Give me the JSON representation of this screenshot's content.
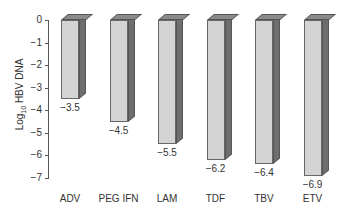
{
  "chart_data": {
    "type": "bar",
    "title": "",
    "xlabel": "",
    "ylabel": "Log10 HBV DNA",
    "ylim": [
      -7,
      0
    ],
    "yticks": [
      0,
      -1,
      -2,
      -3,
      -4,
      -5,
      -6,
      -7
    ],
    "ytick_labels": [
      "0",
      "−1",
      "−2",
      "−3",
      "−4",
      "−5",
      "−6",
      "−7"
    ],
    "categories": [
      "ADV",
      "PEG IFN",
      "LAM",
      "TDF",
      "TBV",
      "ETV"
    ],
    "values": [
      -3.5,
      -4.5,
      -5.5,
      -6.2,
      -6.4,
      -6.9
    ],
    "value_labels": [
      "−3.5",
      "−4.5",
      "−5.5",
      "−6.2",
      "−6.4",
      "−6.9"
    ],
    "grid": false,
    "legend": null,
    "style": "3d-bars",
    "colors": {
      "front": "#d4d4d4",
      "side": "#6e6e6e",
      "top": "#8a8a8a",
      "edge": "#555555"
    }
  },
  "axis": {
    "ylabel_main": "Log",
    "ylabel_sub": "10",
    "ylabel_rest": " HBV DNA"
  }
}
